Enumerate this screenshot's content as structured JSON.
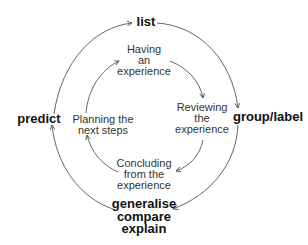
{
  "diagram": {
    "type": "cycle",
    "outer_cycle": {
      "label": "outer-cycle",
      "nodes": [
        {
          "id": "list",
          "lines": [
            "list"
          ]
        },
        {
          "id": "group_label",
          "lines": [
            "group/label"
          ]
        },
        {
          "id": "generalise",
          "lines": [
            "generalise",
            "compare",
            "explain"
          ]
        },
        {
          "id": "predict",
          "lines": [
            "predict"
          ]
        }
      ],
      "direction": "clockwise"
    },
    "inner_cycle": {
      "label": "inner-cycle",
      "nodes": [
        {
          "id": "having",
          "lines": [
            "Having",
            "an",
            "experience"
          ]
        },
        {
          "id": "reviewing",
          "lines": [
            "Reviewing",
            "the",
            "experience"
          ]
        },
        {
          "id": "concluding",
          "lines": [
            "Concluding",
            "from the",
            "experience"
          ]
        },
        {
          "id": "planning",
          "lines": [
            "Planning the",
            "next steps"
          ]
        }
      ],
      "direction": "clockwise"
    },
    "colors": {
      "outer_text": "#111111",
      "inner_text": "#333333",
      "arrow": "#555555",
      "background": "#ffffff"
    }
  }
}
